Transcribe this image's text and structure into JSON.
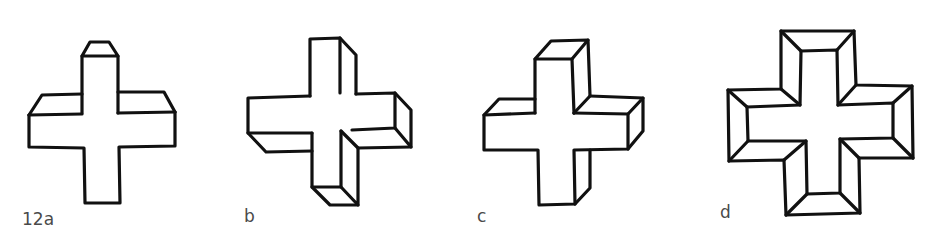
{
  "figure": {
    "line_color": "#111111",
    "label_color": "#4a4a4a",
    "panels": [
      {
        "id": "a",
        "label": "12a",
        "view": "cross viewed from above (top faces visible)"
      },
      {
        "id": "b",
        "label": "b",
        "view": "cross viewed from lower-right (right and bottom faces visible)"
      },
      {
        "id": "c",
        "label": "c",
        "view": "cross viewed from upper-right (top and right faces visible)"
      },
      {
        "id": "d",
        "label": "d",
        "view": "cross with beveled frame seen head-on (inner recessed face)"
      }
    ]
  }
}
